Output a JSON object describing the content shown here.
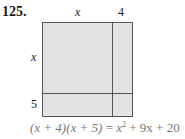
{
  "problem_number": "125.",
  "labels": {
    "top_x": "x",
    "top_4": "4",
    "left_x": "x",
    "left_5": "5"
  },
  "equation": {
    "lhs": "(x + 4)(x + 5)",
    "eq": " = ",
    "rhs_a": "x",
    "rhs_sup": "2",
    "rhs_b": " + 9x + 20"
  },
  "colors": {
    "fill": "#e3e3e3",
    "border": "#555555",
    "equation_text": "#777777"
  }
}
